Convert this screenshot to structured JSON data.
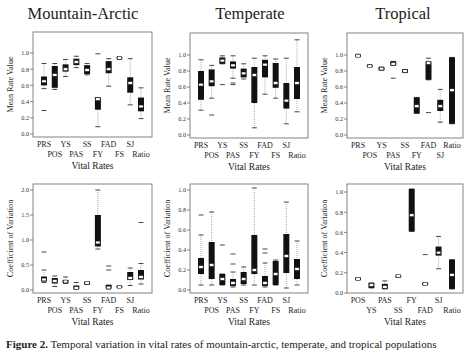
{
  "titles": [
    "Mountain-Arctic",
    "Temperate",
    "Tropical"
  ],
  "caption": {
    "bold": "Figure 2.",
    "text": "Temporal variation in vital rates of mountain-arctic, temperate, and tropical populations"
  },
  "chart_data": [
    {
      "type": "box",
      "panel": "Mountain-Arctic mean",
      "title": "Mountain-Arctic",
      "xlabel": "Vital Rates",
      "ylabel": "Mean Rate Value",
      "ylim": [
        0.0,
        1.2
      ],
      "yticks": [
        0.0,
        0.2,
        0.4,
        0.6,
        0.8,
        1.0
      ],
      "categories": [
        "PRS",
        "POS",
        "YS",
        "PAS",
        "SS",
        "FY",
        "FAD",
        "FS",
        "SJ",
        "Ratio"
      ],
      "boxes": [
        {
          "cat": "PRS",
          "whislo": 0.56,
          "q1": 0.6,
          "med": 0.65,
          "q3": 0.71,
          "whishi": 0.87,
          "outliers": [
            0.29
          ]
        },
        {
          "cat": "POS",
          "whislo": 0.55,
          "q1": 0.57,
          "med": 0.73,
          "q3": 0.84,
          "whishi": 0.87,
          "outliers": []
        },
        {
          "cat": "YS",
          "whislo": 0.71,
          "q1": 0.77,
          "med": 0.8,
          "q3": 0.86,
          "whishi": 0.92,
          "outliers": []
        },
        {
          "cat": "PAS",
          "whislo": 0.82,
          "q1": 0.85,
          "med": 0.89,
          "q3": 0.93,
          "whishi": 0.96,
          "outliers": []
        },
        {
          "cat": "SS",
          "whislo": 0.73,
          "q1": 0.74,
          "med": 0.79,
          "q3": 0.85,
          "whishi": 0.87,
          "outliers": []
        },
        {
          "cat": "FY",
          "whislo": 0.09,
          "q1": 0.3,
          "med": 0.43,
          "q3": 0.45,
          "whishi": 0.45,
          "outliers": [
            0.99
          ]
        },
        {
          "cat": "FAD",
          "whislo": 0.59,
          "q1": 0.75,
          "med": 0.8,
          "q3": 0.9,
          "whishi": 0.93,
          "outliers": []
        },
        {
          "cat": "FS",
          "whislo": 0.92,
          "q1": 0.93,
          "med": 0.94,
          "q3": 0.95,
          "whishi": 0.95,
          "outliers": []
        },
        {
          "cat": "SJ",
          "whislo": 0.36,
          "q1": 0.51,
          "med": 0.63,
          "q3": 0.7,
          "whishi": 0.93,
          "outliers": []
        },
        {
          "cat": "Ratio",
          "whislo": 0.19,
          "q1": 0.28,
          "med": 0.34,
          "q3": 0.45,
          "whishi": 0.57,
          "outliers": []
        }
      ]
    },
    {
      "type": "box",
      "panel": "Temperate mean",
      "title": "Temperate",
      "xlabel": "Vital Rates",
      "ylabel": "Mean Rate Value",
      "ylim": [
        0.0,
        1.2
      ],
      "yticks": [
        0.0,
        0.2,
        0.4,
        0.6,
        0.8,
        1.0
      ],
      "categories": [
        "PRS",
        "POS",
        "YS",
        "PAS",
        "SS",
        "FY",
        "FAD",
        "FS",
        "SJ",
        "Ratio"
      ],
      "boxes": [
        {
          "cat": "PRS",
          "whislo": 0.31,
          "q1": 0.44,
          "med": 0.63,
          "q3": 0.8,
          "whishi": 0.94,
          "outliers": []
        },
        {
          "cat": "POS",
          "whislo": 0.46,
          "q1": 0.61,
          "med": 0.67,
          "q3": 0.82,
          "whishi": 0.87,
          "outliers": [
            0.25
          ]
        },
        {
          "cat": "YS",
          "whislo": 0.89,
          "q1": 0.89,
          "med": 0.93,
          "q3": 0.97,
          "whishi": 0.99,
          "outliers": [
            0.63
          ]
        },
        {
          "cat": "PAS",
          "whislo": 0.71,
          "q1": 0.83,
          "med": 0.87,
          "q3": 0.92,
          "whishi": 0.99,
          "outliers": [
            0.63,
            0.65
          ]
        },
        {
          "cat": "SS",
          "whislo": 0.7,
          "q1": 0.72,
          "med": 0.77,
          "q3": 0.83,
          "whishi": 0.89,
          "outliers": []
        },
        {
          "cat": "FY",
          "whislo": 0.09,
          "q1": 0.4,
          "med": 0.75,
          "q3": 0.85,
          "whishi": 0.96,
          "outliers": []
        },
        {
          "cat": "FAD",
          "whislo": 0.51,
          "q1": 0.72,
          "med": 0.88,
          "q3": 0.94,
          "whishi": 0.99,
          "outliers": []
        },
        {
          "cat": "FS",
          "whislo": 0.46,
          "q1": 0.59,
          "med": 0.65,
          "q3": 0.9,
          "whishi": 0.95,
          "outliers": []
        },
        {
          "cat": "SJ",
          "whislo": 0.14,
          "q1": 0.33,
          "med": 0.43,
          "q3": 0.65,
          "whishi": 0.96,
          "outliers": []
        },
        {
          "cat": "Ratio",
          "whislo": 0.29,
          "q1": 0.45,
          "med": 0.65,
          "q3": 0.85,
          "whishi": 1.19,
          "outliers": []
        }
      ]
    },
    {
      "type": "box",
      "panel": "Tropical mean",
      "title": "Tropical",
      "xlabel": "Vital Rates",
      "ylabel": "Mean Rate Value",
      "ylim": [
        0.0,
        1.2
      ],
      "yticks": [
        0.0,
        0.2,
        0.4,
        0.6,
        0.8,
        1.0
      ],
      "categories": [
        "PRS",
        "POS",
        "YS",
        "PAS",
        "SS",
        "FY",
        "FAD",
        "SJ",
        "Ratio"
      ],
      "boxes": [
        {
          "cat": "PRS",
          "whislo": 0.98,
          "q1": 0.99,
          "med": 0.99,
          "q3": 1.0,
          "whishi": 1.01,
          "outliers": []
        },
        {
          "cat": "POS",
          "whislo": 0.86,
          "q1": 0.86,
          "med": 0.86,
          "q3": 0.87,
          "whishi": 0.88,
          "outliers": []
        },
        {
          "cat": "YS",
          "whislo": 0.81,
          "q1": 0.81,
          "med": 0.83,
          "q3": 0.85,
          "whishi": 0.85,
          "outliers": []
        },
        {
          "cat": "PAS",
          "whislo": 0.87,
          "q1": 0.87,
          "med": 0.89,
          "q3": 0.92,
          "whishi": 0.92,
          "outliers": [
            0.71
          ]
        },
        {
          "cat": "SS",
          "whislo": 0.78,
          "q1": 0.78,
          "med": 0.8,
          "q3": 0.82,
          "whishi": 0.82,
          "outliers": []
        },
        {
          "cat": "FY",
          "whislo": 0.27,
          "q1": 0.27,
          "med": 0.36,
          "q3": 0.47,
          "whishi": 0.47,
          "outliers": []
        },
        {
          "cat": "FAD",
          "whislo": 0.69,
          "q1": 0.69,
          "med": 0.9,
          "q3": 0.92,
          "whishi": 0.96,
          "outliers": [
            0.28
          ]
        },
        {
          "cat": "SJ",
          "whislo": 0.16,
          "q1": 0.3,
          "med": 0.36,
          "q3": 0.44,
          "whishi": 0.57,
          "outliers": []
        },
        {
          "cat": "Ratio",
          "whislo": 0.14,
          "q1": 0.14,
          "med": 0.56,
          "q3": 0.97,
          "whishi": 0.97,
          "outliers": []
        }
      ]
    },
    {
      "type": "box",
      "panel": "Mountain-Arctic CV",
      "xlabel": "Vital Rates",
      "ylabel": "Coefficient of Variation",
      "ylim": [
        -0.03,
        2.1
      ],
      "yticks": [
        0.0,
        0.5,
        1.0,
        1.5,
        2.0
      ],
      "categories": [
        "PRS",
        "POS",
        "YS",
        "PAS",
        "SS",
        "FY",
        "FAD",
        "FS",
        "SJ",
        "Ratio"
      ],
      "boxes": [
        {
          "cat": "PRS",
          "whislo": 0.15,
          "q1": 0.17,
          "med": 0.21,
          "q3": 0.27,
          "whishi": 0.4,
          "outliers": [
            0.76
          ]
        },
        {
          "cat": "POS",
          "whislo": 0.07,
          "q1": 0.13,
          "med": 0.18,
          "q3": 0.24,
          "whishi": 0.28,
          "outliers": []
        },
        {
          "cat": "YS",
          "whislo": 0.13,
          "q1": 0.14,
          "med": 0.17,
          "q3": 0.2,
          "whishi": 0.26,
          "outliers": []
        },
        {
          "cat": "PAS",
          "whislo": 0.01,
          "q1": 0.02,
          "med": 0.04,
          "q3": 0.09,
          "whishi": 0.15,
          "outliers": []
        },
        {
          "cat": "SS",
          "whislo": 0.11,
          "q1": 0.11,
          "med": 0.14,
          "q3": 0.16,
          "whishi": 0.16,
          "outliers": []
        },
        {
          "cat": "FY",
          "whislo": 0.82,
          "q1": 0.87,
          "med": 0.95,
          "q3": 1.5,
          "whishi": 2.0,
          "outliers": []
        },
        {
          "cat": "FAD",
          "whislo": 0.02,
          "q1": 0.03,
          "med": 0.05,
          "q3": 0.1,
          "whishi": 0.1,
          "outliers": [
            0.4,
            0.48
          ]
        },
        {
          "cat": "FS",
          "whislo": 0.05,
          "q1": 0.05,
          "med": 0.06,
          "q3": 0.08,
          "whishi": 0.08,
          "outliers": []
        },
        {
          "cat": "SJ",
          "whislo": 0.09,
          "q1": 0.2,
          "med": 0.24,
          "q3": 0.36,
          "whishi": 0.44,
          "outliers": []
        },
        {
          "cat": "Ratio",
          "whislo": 0.12,
          "q1": 0.21,
          "med": 0.26,
          "q3": 0.4,
          "whishi": 0.53,
          "outliers": [
            1.35
          ]
        }
      ]
    },
    {
      "type": "box",
      "panel": "Temperate CV",
      "xlabel": "Vital Rates",
      "ylabel": "Coefficient of Variation",
      "ylim": [
        -0.02,
        1.07
      ],
      "yticks": [
        0.0,
        0.2,
        0.4,
        0.6,
        0.8,
        1.0
      ],
      "categories": [
        "PRS",
        "POS",
        "YS",
        "PAS",
        "SS",
        "FY",
        "FAD",
        "FS",
        "SJ",
        "Ratio"
      ],
      "boxes": [
        {
          "cat": "PRS",
          "whislo": 0.05,
          "q1": 0.16,
          "med": 0.23,
          "q3": 0.32,
          "whishi": 0.55,
          "outliers": [
            0.75
          ]
        },
        {
          "cat": "POS",
          "whislo": 0.05,
          "q1": 0.11,
          "med": 0.25,
          "q3": 0.48,
          "whishi": 0.78,
          "outliers": []
        },
        {
          "cat": "YS",
          "whislo": 0.05,
          "q1": 0.05,
          "med": 0.11,
          "q3": 0.16,
          "whishi": 0.16,
          "outliers": [
            0.45
          ]
        },
        {
          "cat": "PAS",
          "whislo": 0.03,
          "q1": 0.04,
          "med": 0.07,
          "q3": 0.11,
          "whishi": 0.18,
          "outliers": [
            0.26,
            0.36
          ]
        },
        {
          "cat": "SS",
          "whislo": 0.05,
          "q1": 0.06,
          "med": 0.11,
          "q3": 0.18,
          "whishi": 0.23,
          "outliers": []
        },
        {
          "cat": "FY",
          "whislo": 0.05,
          "q1": 0.16,
          "med": 0.2,
          "q3": 0.55,
          "whishi": 1.02,
          "outliers": []
        },
        {
          "cat": "FAD",
          "whislo": 0.03,
          "q1": 0.04,
          "med": 0.07,
          "q3": 0.14,
          "whishi": 0.27,
          "outliers": [
            0.37,
            0.41
          ]
        },
        {
          "cat": "FS",
          "whislo": 0.05,
          "q1": 0.05,
          "med": 0.16,
          "q3": 0.29,
          "whishi": 0.3,
          "outliers": []
        },
        {
          "cat": "SJ",
          "whislo": 0.02,
          "q1": 0.17,
          "med": 0.34,
          "q3": 0.56,
          "whishi": 0.88,
          "outliers": []
        },
        {
          "cat": "Ratio",
          "whislo": 0.05,
          "q1": 0.11,
          "med": 0.21,
          "q3": 0.31,
          "whishi": 0.49,
          "outliers": []
        }
      ]
    },
    {
      "type": "box",
      "panel": "Tropical CV",
      "xlabel": "Vital Rates",
      "ylabel": "Coefficient of Variation",
      "ylim": [
        -0.01,
        1.07
      ],
      "yticks": [
        0.0,
        0.2,
        0.4,
        0.6,
        0.8,
        1.0
      ],
      "categories": [
        "POS",
        "YS",
        "PAS",
        "SS",
        "FY",
        "FAD",
        "SJ",
        "Ratio"
      ],
      "boxes": [
        {
          "cat": "POS",
          "whislo": 0.13,
          "q1": 0.13,
          "med": 0.14,
          "q3": 0.15,
          "whishi": 0.15,
          "outliers": []
        },
        {
          "cat": "YS",
          "whislo": 0.05,
          "q1": 0.05,
          "med": 0.08,
          "q3": 0.1,
          "whishi": 0.1,
          "outliers": []
        },
        {
          "cat": "PAS",
          "whislo": 0.04,
          "q1": 0.04,
          "med": 0.06,
          "q3": 0.09,
          "whishi": 0.12,
          "outliers": []
        },
        {
          "cat": "SS",
          "whislo": 0.16,
          "q1": 0.16,
          "med": 0.17,
          "q3": 0.17,
          "whishi": 0.17,
          "outliers": []
        },
        {
          "cat": "FY",
          "whislo": 0.61,
          "q1": 0.61,
          "med": 0.77,
          "q3": 1.03,
          "whishi": 1.03,
          "outliers": []
        },
        {
          "cat": "FAD",
          "whislo": 0.08,
          "q1": 0.08,
          "med": 0.09,
          "q3": 0.1,
          "whishi": 0.1,
          "outliers": [
            0.38
          ]
        },
        {
          "cat": "SJ",
          "whislo": 0.24,
          "q1": 0.37,
          "med": 0.4,
          "q3": 0.46,
          "whishi": 0.56,
          "outliers": []
        },
        {
          "cat": "Ratio",
          "whislo": 0.04,
          "q1": 0.04,
          "med": 0.18,
          "q3": 0.33,
          "whishi": 0.33,
          "outliers": []
        }
      ]
    }
  ]
}
